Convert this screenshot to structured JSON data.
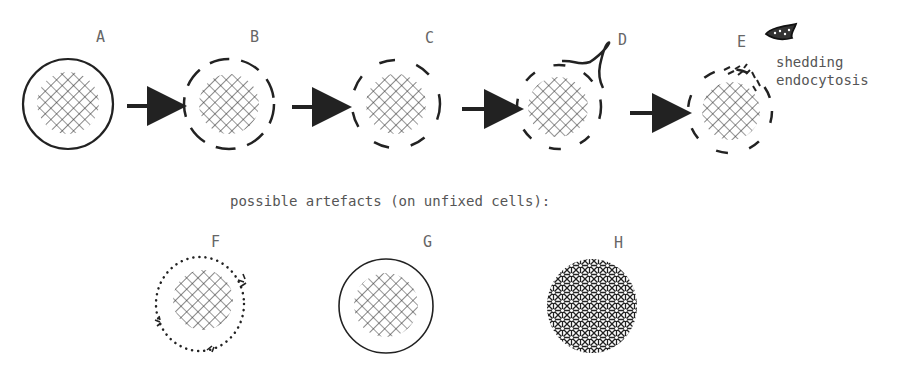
{
  "figure": {
    "stages": [
      {
        "label": "A",
        "membrane": "solid"
      },
      {
        "label": "B",
        "membrane": "dashed"
      },
      {
        "label": "C",
        "membrane": "dashed-sparse"
      },
      {
        "label": "D",
        "membrane": "dashed-with-protrusion"
      },
      {
        "label": "E",
        "membrane": "dashed-fragmenting"
      }
    ],
    "annotation_e": {
      "line1": "shedding",
      "line2": "endocytosis"
    },
    "artefacts_caption": "possible artefacts (on unfixed cells):",
    "artefacts": [
      {
        "label": "F",
        "membrane": "dotted"
      },
      {
        "label": "G",
        "membrane": "thin-solid"
      },
      {
        "label": "H",
        "membrane": "dense-hatch"
      }
    ],
    "colors": {
      "ink": "#222222",
      "label": "#666666",
      "background": "#ffffff"
    }
  }
}
